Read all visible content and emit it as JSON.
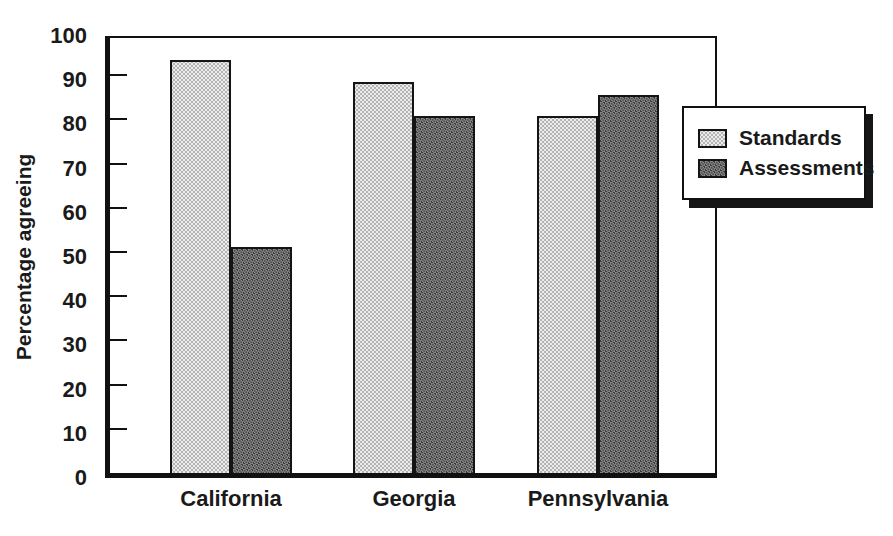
{
  "chart_data": {
    "type": "bar",
    "title": "",
    "categories": [
      "California",
      "Georgia",
      "Pennsylvania"
    ],
    "series": [
      {
        "name": "Standards",
        "values": [
          95,
          90,
          82
        ],
        "fill": "#d9d9d9",
        "pattern": "dots"
      },
      {
        "name": "Assessments",
        "values": [
          52,
          82,
          87
        ],
        "fill": "#6e6e6e",
        "pattern": "crosshatch"
      }
    ],
    "xlabel": "",
    "ylabel": "Percentage agreeing",
    "ylim": [
      0,
      100
    ],
    "yticks": [
      0,
      10,
      20,
      30,
      40,
      50,
      60,
      70,
      80,
      90,
      100
    ],
    "grid": false,
    "legend": {
      "position": "inside-right",
      "entries": [
        "Standards",
        "Assessments"
      ]
    },
    "axis_color": "#111111",
    "text_color": "#1a1a1a",
    "background_color": "#ffffff"
  }
}
